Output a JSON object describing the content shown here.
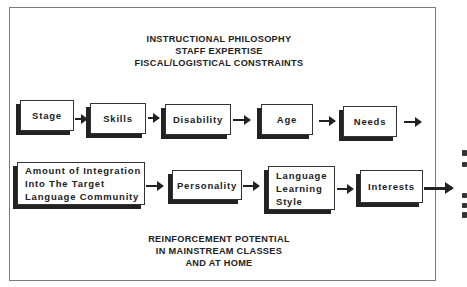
{
  "diagram": {
    "top_context": [
      "INSTRUCTIONAL PHILOSOPHY",
      "STAFF EXPERTISE",
      "FISCAL/LOGISTICAL CONSTRAINTS"
    ],
    "row1": [
      {
        "label": "Stage"
      },
      {
        "label": "Skills"
      },
      {
        "label": "Disability"
      },
      {
        "label": "Age"
      },
      {
        "label": "Needs"
      }
    ],
    "row2": [
      {
        "lines": [
          "Amount of Integration",
          "Into The Target",
          "Language Community"
        ]
      },
      {
        "label": "Personality"
      },
      {
        "lines": [
          "Language",
          "Learning",
          "Style"
        ]
      },
      {
        "label": "Interests"
      }
    ],
    "bottom_context": [
      "REINFORCEMENT POTENTIAL",
      "IN MAINSTREAM CLASSES",
      "AND AT HOME"
    ]
  }
}
